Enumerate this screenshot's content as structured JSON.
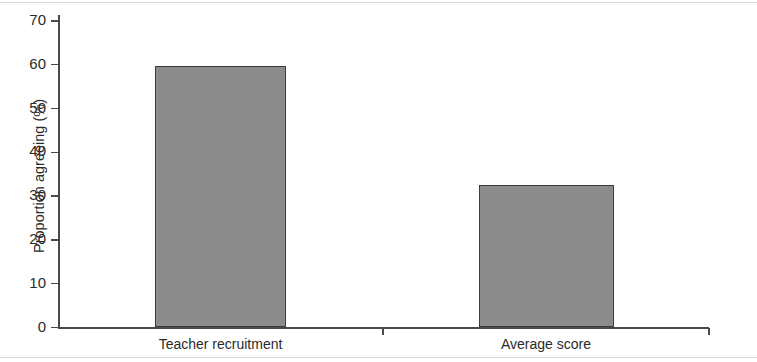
{
  "chart_data": {
    "type": "bar",
    "title": "",
    "subtitle": "",
    "xlabel": "",
    "ylabel": "Proportion agreeing (%)",
    "categories": [
      "Teacher recruitment",
      "Average score"
    ],
    "values": [
      59.8,
      32.5
    ],
    "ylim": [
      0,
      70
    ],
    "yticks": [
      0,
      10,
      20,
      30,
      40,
      50,
      60,
      70
    ],
    "ytick_labels": [
      "0",
      "10",
      "20",
      "30",
      "40",
      "50",
      "60",
      "70"
    ],
    "grid": false,
    "legend": null,
    "bar_color": "#8c8c8c",
    "bar_edge_color": "#3b3b3b",
    "axis_color": "#4a4a4a",
    "text_color": "#2b2b2b",
    "background": "#ffffff"
  }
}
